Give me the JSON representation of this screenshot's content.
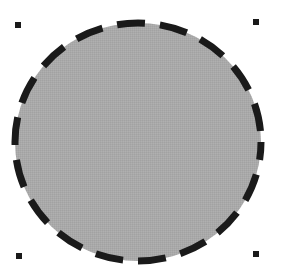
{
  "shape": {
    "type": "ellipse",
    "center": {
      "x": 138,
      "y": 142
    },
    "rx": 123,
    "ry": 119,
    "fill_color": "#a9a9a9",
    "stroke_color": "#1a1a1a",
    "stroke_width": 7,
    "dash_pattern": "28 15",
    "selected": true
  },
  "selection_handles": [
    {
      "name": "top-left",
      "x": 18,
      "y": 25
    },
    {
      "name": "top-right",
      "x": 256,
      "y": 22
    },
    {
      "name": "bottom-left",
      "x": 19,
      "y": 256
    },
    {
      "name": "bottom-right",
      "x": 256,
      "y": 254
    }
  ]
}
